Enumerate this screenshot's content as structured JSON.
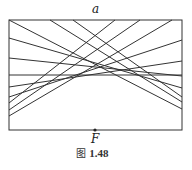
{
  "figure": {
    "caption_prefix": "图",
    "caption_number": "1.48",
    "top_label": "a",
    "focus_label": "F",
    "rect": {
      "x1": 9,
      "y1": 20,
      "x2": 182,
      "y2": 130
    },
    "focus_point": {
      "x": 95,
      "y": 130
    },
    "stroke_color": "#333333",
    "fold_lines": [
      {
        "x1": 9,
        "y1": 20,
        "x2": 182,
        "y2": 109
      },
      {
        "x1": 50,
        "y1": 20,
        "x2": 182,
        "y2": 102
      },
      {
        "x1": 73,
        "y1": 20,
        "x2": 182,
        "y2": 97
      },
      {
        "x1": 9,
        "y1": 38,
        "x2": 182,
        "y2": 88
      },
      {
        "x1": 9,
        "y1": 58,
        "x2": 182,
        "y2": 76
      },
      {
        "x1": 9,
        "y1": 75,
        "x2": 182,
        "y2": 75
      },
      {
        "x1": 182,
        "y1": 61,
        "x2": 9,
        "y2": 87
      },
      {
        "x1": 182,
        "y1": 40,
        "x2": 9,
        "y2": 97
      },
      {
        "x1": 115,
        "y1": 20,
        "x2": 9,
        "y2": 103
      },
      {
        "x1": 140,
        "y1": 20,
        "x2": 9,
        "y2": 110
      },
      {
        "x1": 172,
        "y1": 20,
        "x2": 9,
        "y2": 116
      }
    ]
  }
}
